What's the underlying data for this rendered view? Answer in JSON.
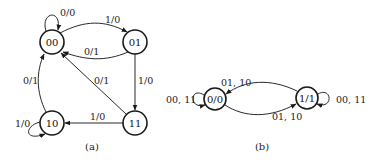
{
  "diagrams": [
    {
      "caption": "(a)",
      "type": "mealy_state_diagram",
      "states": [
        {
          "id": "00",
          "label": "00"
        },
        {
          "id": "01",
          "label": "01"
        },
        {
          "id": "10",
          "label": "10"
        },
        {
          "id": "11",
          "label": "11"
        }
      ],
      "transitions": [
        {
          "from": "00",
          "to": "00",
          "label": "0/0"
        },
        {
          "from": "00",
          "to": "01",
          "label": "1/0"
        },
        {
          "from": "01",
          "to": "00",
          "label": "0/1"
        },
        {
          "from": "01",
          "to": "11",
          "label": "1/0"
        },
        {
          "from": "11",
          "to": "00",
          "label": "0/1"
        },
        {
          "from": "11",
          "to": "10",
          "label": "1/0"
        },
        {
          "from": "10",
          "to": "00",
          "label": "0/1"
        },
        {
          "from": "10",
          "to": "10",
          "label": "1/0"
        }
      ]
    },
    {
      "caption": "(b)",
      "type": "moore_state_diagram",
      "states": [
        {
          "id": "0/0",
          "label": "0/0"
        },
        {
          "id": "1/1",
          "label": "1/1"
        }
      ],
      "transitions": [
        {
          "from": "0/0",
          "to": "0/0",
          "label": "00, 11"
        },
        {
          "from": "1/1",
          "to": "0/0",
          "label": "01, 10"
        },
        {
          "from": "0/0",
          "to": "1/1",
          "label": "01, 10"
        },
        {
          "from": "1/1",
          "to": "1/1",
          "label": "00, 11"
        }
      ]
    }
  ],
  "colors": {
    "stroke": "#1a1a1a",
    "background": "#ffffff"
  }
}
